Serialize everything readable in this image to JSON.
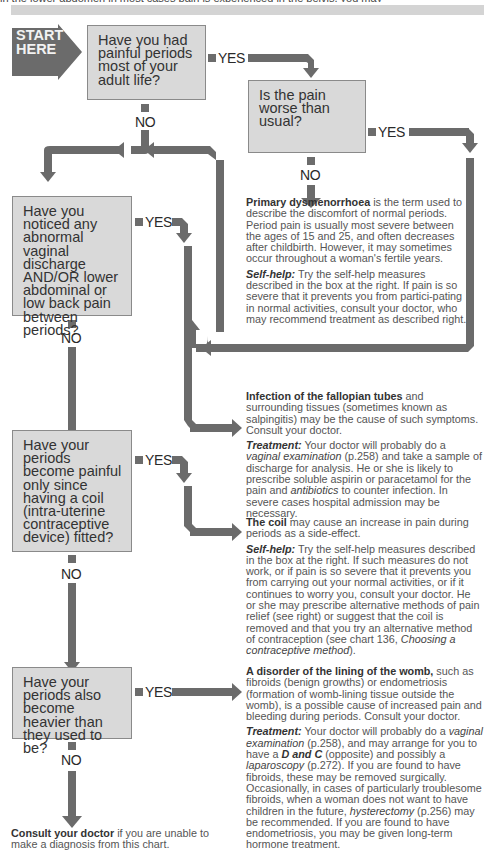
{
  "header": {
    "top_line_text": "in the lower abdomen in most cases pain is experienced in the pelvis, you may"
  },
  "colors": {
    "arrow": "#6b6b6b",
    "question_box": "#d9d9d9",
    "box_border": "#8a8a8a",
    "top_bar": "#d4d4d4",
    "text": "#555555"
  },
  "start": {
    "line1": "START",
    "line2": "HERE"
  },
  "labels": {
    "yes": "YES",
    "no": "NO"
  },
  "questions": [
    {
      "id": "q1",
      "text": "Have you had painful periods most of your adult life?"
    },
    {
      "id": "q2",
      "text": "Is the pain worse than usual?"
    },
    {
      "id": "q3",
      "text": "Have you noticed any abnormal vaginal discharge AND/OR lower abdominal or low back pain between periods?"
    },
    {
      "id": "q4",
      "text": "Have your periods become painful only since having a coil (intra-uterine contraceptive device) fitted?"
    },
    {
      "id": "q5",
      "text": "Have your periods also become heavier than they used to be?"
    }
  ],
  "outcomes": {
    "dysmenorrhoea": {
      "title": "Primary dysmenorrhoea",
      "body": " is the term used to describe the discomfort of normal periods. Period pain is usually most severe between the ages of 15 and 25, and often decreases after childbirth. However, it may sometimes occur throughout a woman's fertile years.",
      "selfhelp_label": "Self-help:",
      "selfhelp_body": " Try the self-help measures described in the box at the right. If pain is so severe that it prevents you from partici-pating in normal activities, consult your doctor, who may recommend treatment as described right."
    },
    "infection": {
      "title": "Infection of the fallopian tubes",
      "body": " and surrounding tissues (sometimes known as salpingitis) may be the cause of such symptoms. Consult your doctor.",
      "treatment_label": "Treatment:",
      "t1": " Your doctor will probably do a ",
      "t_vaginal": "vaginal examination",
      "t2": " (p.258) and take a sample of discharge for analysis. He or she is likely to prescribe soluble aspirin or paracetamol for the pain and ",
      "t_antibiotics": "antibiotics",
      "t3": " to counter infection. In severe cases hospital admission may be necessary."
    },
    "coil": {
      "title": "The coil",
      "body": " may cause an increase in pain during periods as a side-effect.",
      "selfhelp_label": "Self-help:",
      "s1": " Try the self-help measures described in the box at the right. If such measures do not work, or if pain is so severe that it prevents you from carrying out your normal activities, or if it continues to worry you, consult your doctor. He or she may prescribe alternative methods of pain relief (see right) or suggest that the coil is removed and that you try an alternative method of contraception (see chart 136, ",
      "s_chart": "Choosing a contraceptive method",
      "s2": ")."
    },
    "womb": {
      "title": "A disorder of the lining of the womb,",
      "body": " such as fibroids (benign growths) or endometriosis (formation of womb-lining tissue outside the womb), is a possible cause of increased pain and bleeding during periods. Consult your doctor.",
      "treatment_label": "Treatment:",
      "t1": " Your doctor will probably do a ",
      "t_vaginal": "vaginal examination",
      "t2": " (p.258), and may arrange for you to have a ",
      "t_dc": "D and C",
      "t3": " (opposite) and possibly a ",
      "t_lap": "laparoscopy",
      "t4": " (p.272). If you are found to have fibroids, these may be removed surgically. Occasionally, in cases of particularly troublesome fibroids, when a woman does not want to have children in the future, ",
      "t_hyst": "hysterectomy",
      "t5": " (p.256) may be recommended. If you are found to have endometriosis, you may be given long-term hormone treatment."
    },
    "consult": {
      "title": "Consult your doctor",
      "body": " if you are unable to make a diagnosis from this chart."
    }
  }
}
